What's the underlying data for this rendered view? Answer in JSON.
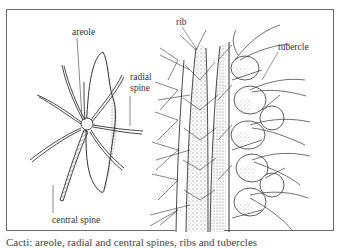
{
  "figure": {
    "labels": {
      "areole": "areole",
      "radial_spine_line1": "radial",
      "radial_spine_line2": "spine",
      "central_spine": "central spine",
      "rib": "rib",
      "tubercle": "tubercle"
    },
    "caption": "Cacti: areole, radial and central spines, ribs and tubercles",
    "colors": {
      "ink": "#333333",
      "frame": "#6a6a6a",
      "background": "#ffffff"
    }
  }
}
